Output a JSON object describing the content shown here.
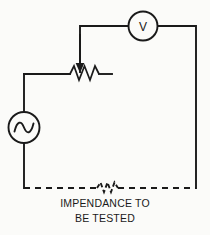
{
  "figure": {
    "kind": "electrical-schematic",
    "background_color": "#fbfbf9",
    "line_color": "#1a1a1a"
  },
  "components": {
    "voltmeter": {
      "icon": "voltmeter-icon",
      "label": "V",
      "shape": "circle"
    },
    "ac_source": {
      "icon": "ac-source-icon",
      "label": "",
      "shape": "circle-with-sine"
    },
    "potentiometer": {
      "icon": "variable-resistor-icon",
      "label": "",
      "shape": "zigzag-with-arrow"
    },
    "device_under_test": {
      "icon": "impedance-icon",
      "label": "",
      "shape": "dashed-zigzag"
    }
  },
  "caption": {
    "line1": "IMPENDANCE TO",
    "line2": "BE TESTED"
  }
}
